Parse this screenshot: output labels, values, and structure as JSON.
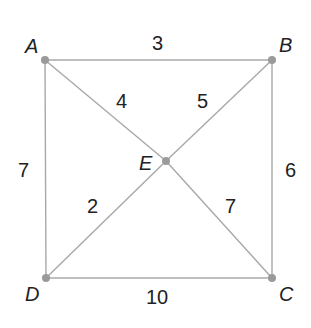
{
  "diagram": {
    "type": "weighted-graph",
    "vertices": [
      {
        "id": "A",
        "label": "A",
        "x": 45,
        "y": 60
      },
      {
        "id": "B",
        "label": "B",
        "x": 272,
        "y": 60
      },
      {
        "id": "C",
        "label": "C",
        "x": 272,
        "y": 278
      },
      {
        "id": "D",
        "label": "D",
        "x": 46,
        "y": 278
      },
      {
        "id": "E",
        "label": "E",
        "x": 166,
        "y": 161
      }
    ],
    "edges": [
      {
        "from": "A",
        "to": "B",
        "weight": "3"
      },
      {
        "from": "B",
        "to": "C",
        "weight": "6"
      },
      {
        "from": "D",
        "to": "C",
        "weight": "10"
      },
      {
        "from": "A",
        "to": "D",
        "weight": "7"
      },
      {
        "from": "A",
        "to": "E",
        "weight": "4"
      },
      {
        "from": "B",
        "to": "E",
        "weight": "5"
      },
      {
        "from": "E",
        "to": "C",
        "weight": "7"
      },
      {
        "from": "D",
        "to": "E",
        "weight": "2"
      }
    ],
    "colors": {
      "edge": "#a8a8a8",
      "vertex": "#9a9a9a",
      "text": "#222222"
    }
  }
}
